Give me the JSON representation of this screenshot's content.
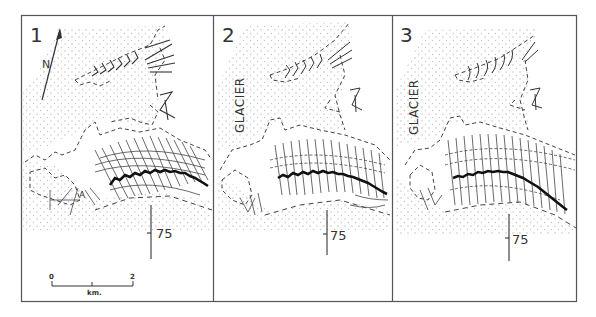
{
  "figure": {
    "type": "multi-panel glacier map",
    "panel_count": 3,
    "colors": {
      "frame": "#555555",
      "ink": "#333333",
      "stipple": "#bbbbbb",
      "background": "#ffffff"
    }
  },
  "panels": [
    {
      "number": "1",
      "glacier_label": "",
      "grid_label": "75",
      "north_label": "N",
      "point_label": "A"
    },
    {
      "number": "2",
      "glacier_label": "GLACIER",
      "grid_label": "75"
    },
    {
      "number": "3",
      "glacier_label": "GLACIER",
      "grid_label": "75"
    }
  ],
  "scale_bar": {
    "start": "0",
    "end": "2",
    "unit": "km."
  }
}
